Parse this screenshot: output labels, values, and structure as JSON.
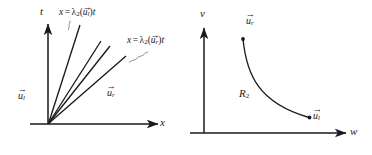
{
  "figure": {
    "type": "diagram",
    "background": "#ffffff",
    "ink": "#1a1a1a",
    "panels": [
      {
        "id": "xt-plane",
        "axes": {
          "vertical_label": "t",
          "horizontal_label": "x",
          "origin": [
            48,
            124
          ]
        },
        "annotations": {
          "left_edge_equation": "x = λ₂(u⃗ₗ)t",
          "right_edge_equation": "x = λ₂(u⃗ᵣ)t",
          "left_state": "u⃗ₗ",
          "right_state": "u⃗ᵣ"
        },
        "fan_rays": 4
      },
      {
        "id": "wv-plane",
        "axes": {
          "vertical_label": "v",
          "horizontal_label": "w",
          "origin": [
            204,
            133
          ]
        },
        "annotations": {
          "curve_label": "R",
          "curve_label_sub": "2",
          "upper_point": "u⃗ᵣ",
          "lower_point": "u⃗ₗ"
        }
      }
    ],
    "symbols": {
      "lambda": "λ",
      "lambda_sub": "2",
      "u": "u",
      "sub_l": "l",
      "sub_r": "r",
      "t": "t",
      "x": "x",
      "v": "v",
      "w": "w",
      "R": "R",
      "R_sub": "2",
      "eq": "=",
      "paren_open": "(",
      "paren_close": ")",
      "arrow_head": "→"
    }
  }
}
